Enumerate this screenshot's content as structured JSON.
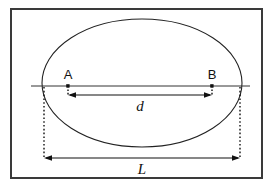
{
  "figure": {
    "type": "geometric-diagram",
    "background_color": "#ffffff",
    "stroke_color": "#111111",
    "border": {
      "name": "figure-border",
      "x": 11,
      "y": 9,
      "width": 251,
      "height": 169,
      "stroke_width": 2,
      "color": "#3a3a3a"
    },
    "ellipse": {
      "name": "ellipse-outline",
      "cx": 142,
      "cy": 83,
      "rx": 100,
      "ry": 64,
      "stroke_width": 1,
      "color": "#222222"
    },
    "axis_line": {
      "name": "horizontal-axis-line",
      "y": 86,
      "x1": 31,
      "x2": 250,
      "stroke_width": 1,
      "color": "#333333"
    },
    "points": [
      {
        "id": "A",
        "label": "A",
        "cx": 68,
        "cy": 86,
        "label_x": 68,
        "label_y": 78
      },
      {
        "id": "B",
        "label": "B",
        "cx": 212,
        "cy": 86,
        "label_x": 212,
        "label_y": 78
      }
    ],
    "dimensions": [
      {
        "id": "d",
        "label": "d",
        "description": "distance between point A and point B",
        "y": 95,
        "x1": 68,
        "x2": 212,
        "arrowheads": "both",
        "label_x": 140,
        "label_y": 110,
        "leader_from": [
          "A",
          "B"
        ]
      },
      {
        "id": "L",
        "label": "L",
        "description": "overall width of the ellipse",
        "y": 158,
        "x1": 44,
        "x2": 240,
        "arrowheads": "both",
        "label_x": 142,
        "label_y": 174,
        "leader_from": [
          "ellipse-left",
          "ellipse-right"
        ]
      }
    ],
    "leader_lines": [
      {
        "name": "leader-from-a",
        "x": 68,
        "y1": 86,
        "y2": 96
      },
      {
        "name": "leader-from-b",
        "x": 212,
        "y1": 86,
        "y2": 96
      },
      {
        "name": "leader-from-ellipse-left",
        "x": 44,
        "y1": 87,
        "y2": 159
      },
      {
        "name": "leader-from-ellipse-right",
        "x": 240,
        "y1": 87,
        "y2": 159
      }
    ]
  }
}
